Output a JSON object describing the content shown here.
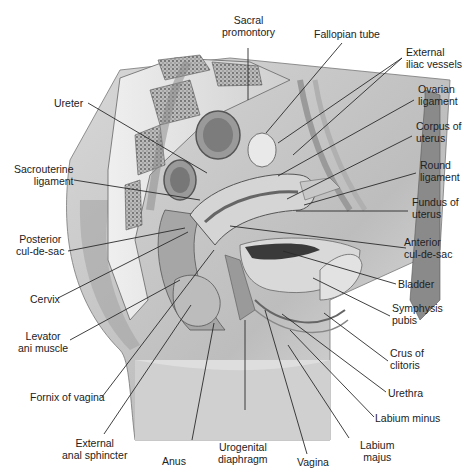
{
  "figure": {
    "labels": {
      "sacral_promontory": [
        "Sacral",
        "promontory"
      ],
      "fallopian_tube": [
        "Fallopian tube"
      ],
      "external_iliac_vessels": [
        "External",
        "iliac vessels"
      ],
      "ovarian_ligament": [
        "Ovarian",
        "ligament"
      ],
      "corpus_of_uterus": [
        "Corpus of",
        "uterus"
      ],
      "round_ligament": [
        "Round",
        "ligament"
      ],
      "fundus_of_uterus": [
        "Fundus of",
        "uterus"
      ],
      "anterior_cul_de_sac": [
        "Anterior",
        "cul-de-sac"
      ],
      "bladder": [
        "Bladder"
      ],
      "symphysis_pubis": [
        "Symphysis",
        "pubis"
      ],
      "crus_of_clitoris": [
        "Crus of",
        "clitoris"
      ],
      "urethra": [
        "Urethra"
      ],
      "labium_minus": [
        "Labium minus"
      ],
      "labium_majus": [
        "Labium",
        "majus"
      ],
      "vagina": [
        "Vagina"
      ],
      "urogenital_diaphragm": [
        "Urogenital",
        "diaphragm"
      ],
      "anus": [
        "Anus"
      ],
      "external_anal_sphincter": [
        "External",
        "anal sphincter"
      ],
      "fornix_of_vagina": [
        "Fornix of vagina"
      ],
      "levator_ani_muscle": [
        "Levator",
        "ani muscle"
      ],
      "cervix": [
        "Cervix"
      ],
      "posterior_cul_de_sac": [
        "Posterior",
        "cul-de-sac"
      ],
      "sacrouterine_ligament": [
        "Sacrouterine",
        "ligament"
      ],
      "ureter": [
        "Ureter"
      ]
    }
  }
}
